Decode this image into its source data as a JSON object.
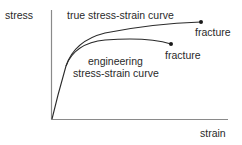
{
  "diagram": {
    "axes": {
      "y_label": "stress",
      "x_label": "strain",
      "color": "#8a8a8a"
    },
    "curves": [
      {
        "name": "true stress-strain curve",
        "label": "true stress-strain curve",
        "end_label": "fracture",
        "color": "#2a2a2a"
      },
      {
        "name": "engineering stress-strain curve",
        "label_line1": "engineering",
        "label_line2": "stress-strain curve",
        "end_label": "fracture",
        "color": "#2a2a2a"
      }
    ]
  }
}
